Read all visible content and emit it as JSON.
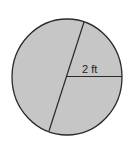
{
  "diagram": {
    "shape": "circle",
    "radius_label": "2 ft",
    "fill_color": "#c6c6c6",
    "stroke_color": "#2a2a2a",
    "background_color": "#ffffff"
  }
}
